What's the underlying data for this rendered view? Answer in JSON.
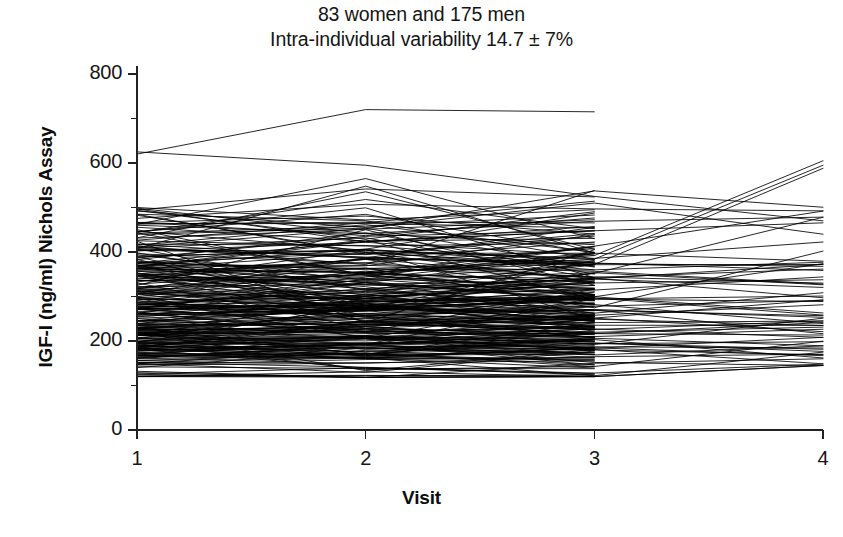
{
  "figure": {
    "title_lines": [
      "83 women and 175 men",
      "Intra-individual variability 14.7 ± 7%"
    ],
    "y_axis_label": "IGF-I (ng/ml) Nichols Assay",
    "x_axis_label": "Visit"
  },
  "chart_data": {
    "type": "line",
    "title": "83 women and 175 men\nIntra-individual variability 14.7 ± 7%",
    "subtitle": "Intra-individual variability 14.7 ± 7%",
    "xlabel": "Visit",
    "ylabel": "IGF-I (ng/ml) Nichols Assay",
    "x": [
      1,
      2,
      3,
      4
    ],
    "x_tick_labels": [
      "1",
      "2",
      "3",
      "4"
    ],
    "xlim": [
      1,
      4
    ],
    "ylim": [
      0,
      800
    ],
    "y_ticks_major": [
      0,
      200,
      400,
      600,
      800
    ],
    "y_ticks_minor": [
      100,
      300,
      500,
      700
    ],
    "y_tick_labels": [
      "0",
      "200",
      "400",
      "600",
      "800"
    ],
    "grid": false,
    "legend": false,
    "n_subjects": 258,
    "n_women": 83,
    "n_men": 175,
    "intra_individual_variability_pct": 14.7,
    "intra_individual_variability_sd_pct": 7,
    "line_color": "#000000",
    "line_width": 0.85,
    "data_range_observed": {
      "visit1": [
        120,
        625
      ],
      "visit2": [
        118,
        720
      ],
      "visit3": [
        120,
        715
      ],
      "visit4": [
        145,
        605
      ]
    },
    "dense_band": [
      150,
      470
    ],
    "notes": [
      "Topmost trajectory: ~620 at visit 1, ~720 at visit 2, ~715 at visit 3, ends at visit 3.",
      "Second high trajectory: ~625 at visit 1, ~595 at visit 2, ~525 at visit 3, then rises toward visit 4.",
      "Two trajectories reach ~605 and ~590 at visit 4.",
      "A sharp vertical edge at visit 3 marks where the majority of series terminate."
    ],
    "series_generation": {
      "method": "deterministic-lcg",
      "seed": 20240117,
      "n_full": 62,
      "n_to_visit3": 196,
      "baseline_median": 285,
      "baseline_spread": 105,
      "baseline_min": 120,
      "baseline_max": 505,
      "visit_cv": 0.147,
      "visit_cv_sd": 0.07
    },
    "outlier_series": [
      {
        "name": "subject-high-1",
        "values": [
          620,
          720,
          715,
          null
        ]
      },
      {
        "name": "subject-high-2",
        "values": [
          625,
          595,
          525,
          470
        ]
      },
      {
        "name": "subject-peak-v2",
        "values": [
          462,
          565,
          430,
          null
        ]
      },
      {
        "name": "subject-peak-v2b",
        "values": [
          408,
          548,
          398,
          null
        ]
      },
      {
        "name": "subject-rise-v4a",
        "values": [
          300,
          352,
          392,
          605
        ]
      },
      {
        "name": "subject-rise-v4b",
        "values": [
          286,
          338,
          372,
          588
        ]
      },
      {
        "name": "subject-rise-v4c",
        "values": [
          258,
          300,
          352,
          478
        ]
      },
      {
        "name": "subject-low-1",
        "values": [
          132,
          118,
          150,
          160
        ]
      },
      {
        "name": "subject-low-2",
        "values": [
          126,
          140,
          128,
          148
        ]
      },
      {
        "name": "subject-low-3",
        "values": [
          152,
          162,
          122,
          175
        ]
      },
      {
        "name": "subject-flat-high",
        "values": [
          500,
          472,
          495,
          null
        ]
      },
      {
        "name": "subject-dip-v3",
        "values": [
          492,
          455,
          510,
          440
        ]
      }
    ]
  },
  "geometry": {
    "plot_left": 137,
    "plot_right": 823,
    "y_zero": 430,
    "y_800": 74,
    "tick_len_major": 9,
    "tick_len_minor": 6
  }
}
